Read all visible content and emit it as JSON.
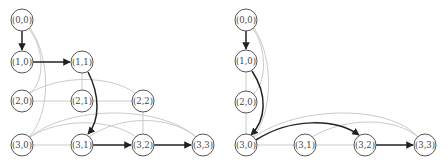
{
  "graphs": [
    {
      "id": "left",
      "nodes": [
        {
          "id": "n00",
          "label": "(0,0)",
          "x": 22,
          "y": 20
        },
        {
          "id": "n10",
          "label": "(1,0)",
          "x": 22,
          "y": 62
        },
        {
          "id": "n11",
          "label": "(1,1)",
          "x": 82,
          "y": 62
        },
        {
          "id": "n20",
          "label": "(2,0)",
          "x": 22,
          "y": 101
        },
        {
          "id": "n21",
          "label": "(2,1)",
          "x": 82,
          "y": 101
        },
        {
          "id": "n22",
          "label": "(2,2)",
          "x": 143,
          "y": 101
        },
        {
          "id": "n30",
          "label": "(3,0)",
          "x": 22,
          "y": 145
        },
        {
          "id": "n31",
          "label": "(3,1)",
          "x": 82,
          "y": 145
        },
        {
          "id": "n32",
          "label": "(3,2)",
          "x": 143,
          "y": 145
        },
        {
          "id": "n33",
          "label": "(3,3)",
          "x": 203,
          "y": 145
        }
      ],
      "bold_path": [
        "(0,0)",
        "(1,0)",
        "(1,1)",
        "(3,1)",
        "(3,2)",
        "(3,3)"
      ]
    },
    {
      "id": "right",
      "nodes": [
        {
          "id": "n00",
          "label": "(0,0)",
          "x": 246,
          "y": 20
        },
        {
          "id": "n10",
          "label": "(1,0)",
          "x": 246,
          "y": 61
        },
        {
          "id": "n20",
          "label": "(2,0)",
          "x": 246,
          "y": 102
        },
        {
          "id": "n30",
          "label": "(3,0)",
          "x": 246,
          "y": 145
        },
        {
          "id": "n31",
          "label": "(3,1)",
          "x": 305,
          "y": 145
        },
        {
          "id": "n32",
          "label": "(3,2)",
          "x": 365,
          "y": 145
        },
        {
          "id": "n33",
          "label": "(3,3)",
          "x": 425,
          "y": 145
        }
      ],
      "bold_path": [
        "(0,0)",
        "(1,0)",
        "(3,0)",
        "(3,2)",
        "(3,3)"
      ]
    }
  ]
}
